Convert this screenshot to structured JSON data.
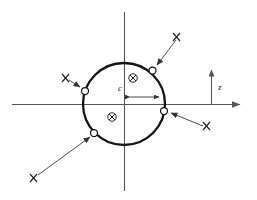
{
  "figure": {
    "type": "technical-diagram",
    "background_color": "#ffffff",
    "line_color": "#1a1a1a",
    "axis_color": "#555555",
    "marker_fill": "#ffffff",
    "labels": {
      "dimension_c": "c",
      "axis_z": "z"
    },
    "axes": {
      "horizontal": {
        "x1": 12,
        "y1": 104,
        "x2": 243,
        "y2": 104,
        "arrow": "right"
      },
      "vertical": {
        "x1": 124,
        "y1": 12,
        "x2": 124,
        "y2": 191,
        "arrow": "none"
      },
      "z_indicator": {
        "x": 211,
        "y_base": 104,
        "y_tip": 69,
        "arrow": "up",
        "label": "z"
      }
    },
    "circle": {
      "cx": 124,
      "cy": 104,
      "r": 41,
      "stroke_width": 2.2
    },
    "dimension": {
      "label": "c",
      "from_x": 124,
      "to_x": 165,
      "y": 97,
      "arrow": "both"
    },
    "cross_symbols": [
      {
        "name": "into-page-symbol-upper",
        "cx": 133,
        "cy": 78,
        "r": 4
      },
      {
        "name": "into-page-symbol-lower",
        "cx": 112,
        "cy": 117,
        "r": 4
      }
    ],
    "ring_markers": [
      {
        "name": "ring-marker-top-right",
        "cx": 152,
        "cy": 70,
        "r": 3.4
      },
      {
        "name": "ring-marker-left",
        "cx": 85,
        "cy": 91,
        "r": 3.4
      },
      {
        "name": "ring-marker-right",
        "cx": 164,
        "cy": 111,
        "r": 3.4
      },
      {
        "name": "ring-marker-bottom-left",
        "cx": 94,
        "cy": 133,
        "r": 3.4
      }
    ],
    "force_arrows": [
      {
        "name": "force-arrow-top-right",
        "tail_x": 178,
        "tail_y": 38,
        "head_x": 156,
        "head_y": 66,
        "marker_label": "x",
        "marker_x": 177,
        "marker_y": 37
      },
      {
        "name": "force-arrow-left",
        "tail_x": 67,
        "tail_y": 79,
        "head_x": 81,
        "head_y": 88,
        "marker_label": "x",
        "marker_x": 66,
        "marker_y": 78
      },
      {
        "name": "force-arrow-right-lower",
        "tail_x": 206,
        "tail_y": 127,
        "head_x": 169,
        "head_y": 113,
        "marker_label": "x",
        "marker_x": 205,
        "marker_y": 126
      },
      {
        "name": "force-arrow-bottom-left",
        "tail_x": 34,
        "tail_y": 178,
        "head_x": 91,
        "head_y": 137,
        "marker_label": "x",
        "marker_x": 33,
        "marker_y": 179
      }
    ]
  }
}
